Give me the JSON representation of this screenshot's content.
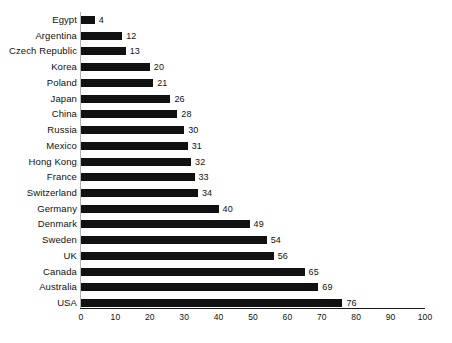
{
  "chart_data": {
    "type": "bar",
    "orientation": "horizontal",
    "title": "",
    "subtitle": "",
    "xlabel": "",
    "ylabel": "",
    "xlim": [
      0,
      100
    ],
    "xticks": [
      0,
      10,
      20,
      30,
      40,
      50,
      60,
      70,
      80,
      90,
      100
    ],
    "grid": false,
    "legend": false,
    "data_labels": true,
    "bar_color": "#111111",
    "background_color": "#ffffff",
    "axis_color": "#1a1a1a",
    "categories": [
      "Egypt",
      "Argentina",
      "Czech Republic",
      "Korea",
      "Poland",
      "Japan",
      "China",
      "Russia",
      "Mexico",
      "Hong Kong",
      "France",
      "Switzerland",
      "Germany",
      "Denmark",
      "Sweden",
      "UK",
      "Canada",
      "Australia",
      "USA"
    ],
    "values": [
      4,
      12,
      13,
      20,
      21,
      26,
      28,
      30,
      31,
      32,
      33,
      34,
      40,
      49,
      54,
      56,
      65,
      69,
      76
    ]
  }
}
